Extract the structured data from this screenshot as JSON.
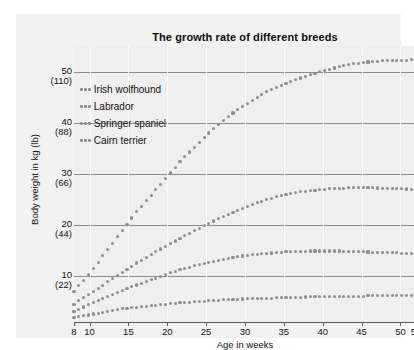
{
  "chart_data": {
    "type": "line",
    "title": "The growth rate of different breeds",
    "xlabel": "Age in weeks",
    "ylabel": "Body weight in kg (lb)",
    "xlim": [
      8,
      52
    ],
    "ylim": [
      0,
      55
    ],
    "grid": true,
    "legend_position": "top-left",
    "marker_style": "dotted",
    "x_ticks": [
      8,
      10,
      15,
      20,
      25,
      30,
      35,
      40,
      45,
      50,
      52
    ],
    "x_tick_labels": [
      "8",
      "10",
      "15",
      "20",
      "25",
      "30",
      "35",
      "40",
      "45",
      "50",
      "52"
    ],
    "y_ticks": [
      10,
      20,
      30,
      40,
      50
    ],
    "y_tick_labels_kg": [
      "10",
      "20",
      "30",
      "40",
      "50"
    ],
    "y_tick_labels_lb": [
      "(22)",
      "(44)",
      "(66)",
      "(88)",
      "(110)"
    ],
    "series": [
      {
        "name": "Irish wolfhound",
        "x": [
          8,
          10,
          12,
          14,
          16,
          18,
          20,
          22,
          24,
          26,
          28,
          30,
          32,
          34,
          36,
          38,
          40,
          42,
          44,
          46,
          48,
          50,
          52
        ],
        "values": [
          7.0,
          10.5,
          14.5,
          18.5,
          22.5,
          26.0,
          29.5,
          33.0,
          36.0,
          39.0,
          41.5,
          43.5,
          45.5,
          47.0,
          48.2,
          49.3,
          50.2,
          51.0,
          51.6,
          52.0,
          52.2,
          52.3,
          52.4
        ]
      },
      {
        "name": "Labrador",
        "x": [
          8,
          10,
          12,
          14,
          16,
          18,
          20,
          22,
          24,
          26,
          28,
          30,
          32,
          34,
          36,
          38,
          40,
          42,
          44,
          46,
          48,
          50,
          52
        ],
        "values": [
          4.5,
          6.5,
          8.5,
          10.5,
          12.5,
          14.3,
          16.0,
          17.7,
          19.3,
          20.8,
          22.2,
          23.5,
          24.6,
          25.5,
          26.2,
          26.7,
          27.0,
          27.2,
          27.3,
          27.3,
          27.2,
          27.1,
          27.0
        ]
      },
      {
        "name": "Springer spaniel",
        "x": [
          8,
          10,
          12,
          14,
          16,
          18,
          20,
          22,
          24,
          26,
          28,
          30,
          32,
          34,
          36,
          38,
          40,
          42,
          44,
          46,
          48,
          50,
          52
        ],
        "values": [
          3.0,
          4.5,
          5.8,
          7.0,
          8.2,
          9.3,
          10.4,
          11.4,
          12.2,
          12.9,
          13.5,
          14.0,
          14.3,
          14.6,
          14.8,
          14.9,
          14.9,
          14.9,
          14.8,
          14.7,
          14.6,
          14.5,
          14.4
        ]
      },
      {
        "name": "Cairn terrier",
        "x": [
          8,
          10,
          12,
          14,
          16,
          18,
          20,
          22,
          24,
          26,
          28,
          30,
          32,
          34,
          36,
          38,
          40,
          42,
          44,
          46,
          48,
          50,
          52
        ],
        "values": [
          1.8,
          2.4,
          3.0,
          3.5,
          3.9,
          4.2,
          4.5,
          4.8,
          5.0,
          5.2,
          5.4,
          5.5,
          5.6,
          5.7,
          5.8,
          5.9,
          5.9,
          6.0,
          6.0,
          6.1,
          6.1,
          6.2,
          6.2
        ]
      }
    ]
  },
  "colors": {
    "marker": "#8d8d8d",
    "gridline": "#8c8c8c",
    "plot_background": "#efefef",
    "frame_background": "#f2f2f2",
    "text": "#111111"
  }
}
